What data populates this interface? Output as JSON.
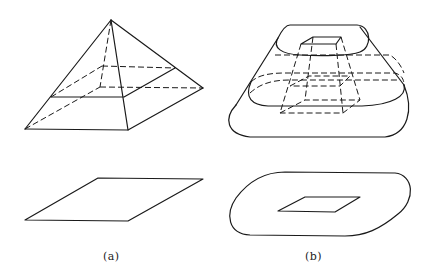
{
  "figure": {
    "panels": [
      {
        "id": "a",
        "caption": "(a)",
        "top_shape": "pyramid with horizontal cross-section (hidden edges dashed)",
        "bottom_shape": "parallelogram (square base in projection)"
      },
      {
        "id": "b",
        "caption": "(b)",
        "top_shape": "rounded solid with inner frustum and contour sections (hidden edges dashed)",
        "bottom_shape": "rounded outline with inner parallelogram"
      }
    ],
    "colors": {
      "stroke": "#1a1a1a",
      "background": "#ffffff"
    }
  }
}
